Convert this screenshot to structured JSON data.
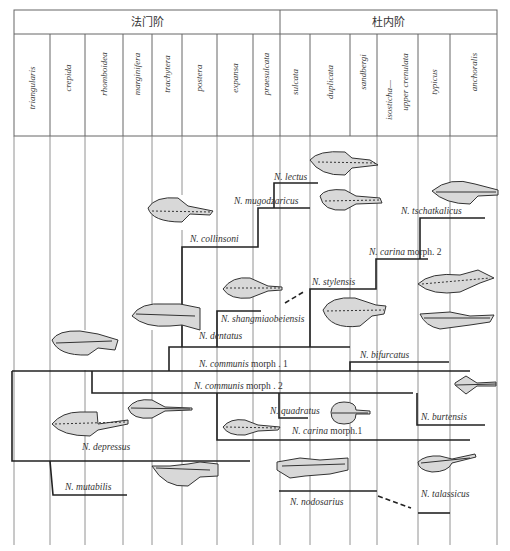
{
  "stages": [
    {
      "label": "法门阶",
      "x1": 14,
      "x2": 280
    },
    {
      "label": "杜内阶",
      "x1": 280,
      "x2": 497
    }
  ],
  "zones": [
    {
      "label": "triangularis",
      "x1": 14,
      "x2": 50
    },
    {
      "label": "crepida",
      "x1": 50,
      "x2": 85
    },
    {
      "label": "rhomboidea",
      "x1": 85,
      "x2": 123
    },
    {
      "label": "marginifera",
      "x1": 123,
      "x2": 152
    },
    {
      "label": "trachytera",
      "x1": 152,
      "x2": 182
    },
    {
      "label": "postera",
      "x1": 182,
      "x2": 217
    },
    {
      "label": "expansa",
      "x1": 217,
      "x2": 253
    },
    {
      "label": "praesulcata",
      "x1": 253,
      "x2": 280
    },
    {
      "label": "sulcata",
      "x1": 280,
      "x2": 310
    },
    {
      "label": "duplicata",
      "x1": 310,
      "x2": 350
    },
    {
      "label": "sandbergi",
      "x1": 350,
      "x2": 377
    },
    {
      "label": "isosticha—",
      "label2": "upper crenulata",
      "x1": 377,
      "x2": 418
    },
    {
      "label": "typicus",
      "x1": 418,
      "x2": 450
    },
    {
      "label": "anchoralis",
      "x1": 450,
      "x2": 497
    }
  ],
  "taxa": [
    {
      "id": "lectus",
      "prefix": "N. ",
      "species": "lectus",
      "suffix": "",
      "x": 274,
      "y": 182
    },
    {
      "id": "mugodzharicus",
      "prefix": "N. ",
      "species": "mugodzaricus",
      "suffix": "",
      "x": 234,
      "y": 204
    },
    {
      "id": "collinsoni",
      "prefix": "N. ",
      "species": "collinsoni",
      "suffix": "",
      "x": 190,
      "y": 242
    },
    {
      "id": "tschatkalicus",
      "prefix": "N. ",
      "species": "tschatkalicus",
      "suffix": "",
      "x": 401,
      "y": 218
    },
    {
      "id": "carina-2",
      "prefix": "N. ",
      "species": "carina",
      "suffix": " morph. 2",
      "x": 369,
      "y": 258
    },
    {
      "id": "stylensis",
      "prefix": "N. ",
      "species": "stylensis",
      "suffix": "",
      "x": 312,
      "y": 286
    },
    {
      "id": "shangmiaobeiensis",
      "prefix": "N. ",
      "species": "shangmiaobeiensis",
      "suffix": "",
      "x": 221,
      "y": 322
    },
    {
      "id": "dentatus",
      "prefix": "N. ",
      "species": "dentatus",
      "suffix": "",
      "x": 199,
      "y": 339
    },
    {
      "id": "bifurcatus",
      "prefix": "N. ",
      "species": "bifurcatus",
      "suffix": "",
      "x": 360,
      "y": 358
    },
    {
      "id": "communis-1",
      "prefix": "N. ",
      "species": "communis",
      "suffix": " morph . 1",
      "x": 199,
      "y": 367
    },
    {
      "id": "communis-2",
      "prefix": "N. ",
      "species": "communis",
      "suffix": " morph . 2",
      "x": 194,
      "y": 390
    },
    {
      "id": "quadratus",
      "prefix": "N. ",
      "species": "quadratus",
      "suffix": "",
      "x": 270,
      "y": 414
    },
    {
      "id": "burtensis",
      "prefix": "N. ",
      "species": "burtensis",
      "suffix": "",
      "x": 421,
      "y": 420
    },
    {
      "id": "carina-1",
      "prefix": "N. ",
      "species": "carina",
      "suffix": " morph.1",
      "x": 292,
      "y": 434
    },
    {
      "id": "depressus",
      "prefix": "N. ",
      "species": "depressus",
      "suffix": "",
      "x": 82,
      "y": 450
    },
    {
      "id": "mutabilis",
      "prefix": "N. ",
      "species": "mutabilis",
      "suffix": "",
      "x": 65,
      "y": 490
    },
    {
      "id": "talassicus",
      "prefix": "N. ",
      "species": "talassicus",
      "suffix": "",
      "x": 421,
      "y": 497
    },
    {
      "id": "nodosarius",
      "prefix": "N. ",
      "species": "nodosarius",
      "suffix": "",
      "x": 290,
      "y": 505
    }
  ],
  "colors": {
    "grid": "#555555",
    "lineage": "#222222",
    "specimen_fill": "#d8d8d8",
    "specimen_stroke": "#333333"
  }
}
